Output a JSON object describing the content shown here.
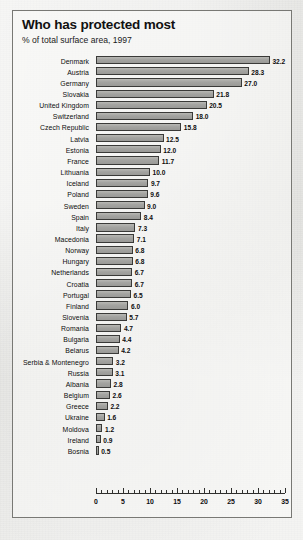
{
  "chart_data": {
    "type": "bar",
    "orientation": "horizontal",
    "title": "Who has protected most",
    "subtitle": "% of total surface area, 1997",
    "xlabel": "",
    "ylabel": "",
    "xlim": [
      0,
      35
    ],
    "xticks": [
      0,
      5,
      10,
      15,
      20,
      25,
      30,
      35
    ],
    "xtick_labels": [
      "0",
      "5",
      "10",
      "15",
      "20",
      "25",
      "30",
      "35"
    ],
    "minor_tick_interval": 1,
    "grid": false,
    "legend": null,
    "bar_color": "#a3a3a0",
    "bar_edge_color": "#3a3a38",
    "categories": [
      "Denmark",
      "Austria",
      "Germany",
      "Slovakia",
      "United Kingdom",
      "Switzerland",
      "Czech Republic",
      "Latvia",
      "Estonia",
      "France",
      "Lithuania",
      "Iceland",
      "Poland",
      "Sweden",
      "Spain",
      "Italy",
      "Macedonia",
      "Norway",
      "Hungary",
      "Netherlands",
      "Croatia",
      "Portugal",
      "Finland",
      "Slovenia",
      "Romania",
      "Bulgaria",
      "Belarus",
      "Serbia & Montenegro",
      "Russia",
      "Albania",
      "Belgium",
      "Greece",
      "Ukraine",
      "Moldova",
      "Ireland",
      "Bosnia"
    ],
    "values": [
      32.2,
      28.3,
      27.0,
      21.8,
      20.5,
      18.0,
      15.8,
      12.5,
      12.0,
      11.7,
      10.0,
      9.7,
      9.6,
      9.0,
      8.4,
      7.3,
      7.1,
      6.8,
      6.8,
      6.7,
      6.7,
      6.5,
      6.0,
      5.7,
      4.7,
      4.4,
      4.2,
      3.2,
      3.1,
      2.8,
      2.6,
      2.2,
      1.6,
      1.2,
      0.9,
      0.5
    ],
    "value_labels": [
      "32.2",
      "28.3",
      "27.0",
      "21.8",
      "20.5",
      "18.0",
      "15.8",
      "12.5",
      "12.0",
      "11.7",
      "10.0",
      "9.7",
      "9.6",
      "9.0",
      "8.4",
      "7.3",
      "7.1",
      "6.8",
      "6.8",
      "6.7",
      "6.7",
      "6.5",
      "6.0",
      "5.7",
      "4.7",
      "4.4",
      "4.2",
      "3.2",
      "3.1",
      "2.8",
      "2.6",
      "2.2",
      "1.6",
      "1.2",
      "0.9",
      "0.5"
    ]
  }
}
